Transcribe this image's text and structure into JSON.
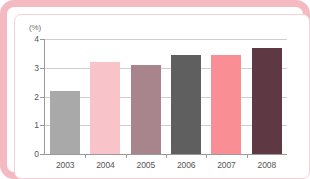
{
  "chart_data": {
    "type": "bar",
    "title": "",
    "xlabel": "",
    "ylabel": "(%)",
    "unit_label": "(%)",
    "categories": [
      "2003",
      "2004",
      "2005",
      "2006",
      "2007",
      "2008"
    ],
    "values": [
      2.2,
      3.2,
      3.1,
      3.45,
      3.45,
      3.7
    ],
    "ylim": [
      0,
      4
    ],
    "yticks": [
      "0",
      "1",
      "2",
      "3",
      "4"
    ],
    "ytick_values": [
      0,
      1,
      2,
      3,
      4
    ],
    "grid": true,
    "legend": "none",
    "bar_colors": [
      "#a9a9a9",
      "#f9c3ca",
      "#a8848d",
      "#5f5f5f",
      "#f98f94",
      "#5e3842"
    ]
  },
  "frame": {
    "border_color": "#f4b9c1",
    "inner_border_color": "#f4d3d8",
    "background": "#ffffff"
  },
  "axis": {
    "line_color": "#9a9a9a",
    "grid_color": "#cfcfcf",
    "tick_text_color": "#555555"
  }
}
